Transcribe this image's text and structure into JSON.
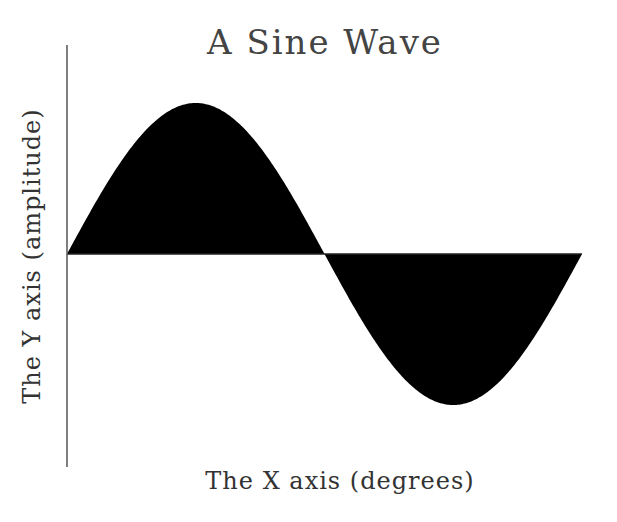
{
  "chart_data": {
    "type": "area",
    "title": "A Sine Wave",
    "xlabel": "The X axis (degrees)",
    "ylabel": "The Y axis (amplitude)",
    "x": [
      0,
      30,
      60,
      90,
      120,
      150,
      180,
      210,
      240,
      270,
      300,
      330,
      360
    ],
    "series": [
      {
        "name": "sin(x)",
        "values": [
          0,
          0.5,
          0.866,
          1,
          0.866,
          0.5,
          0,
          -0.5,
          -0.866,
          -1,
          -0.866,
          -0.5,
          0
        ],
        "fill": "#000000"
      }
    ],
    "xlim": [
      0,
      360
    ],
    "ylim": [
      -1.4,
      1.4
    ],
    "grid": false,
    "legend": "none",
    "tick_labels": false
  },
  "colors": {
    "fill": "#000000",
    "axis": "#555555",
    "text": "#333333",
    "background": "#ffffff"
  },
  "layout_px": {
    "axis_x": 67,
    "axis_top": 45,
    "axis_bottom": 467,
    "baseline_y": 254,
    "wave_x_start": 67,
    "wave_x_end": 582,
    "amplitude_px": 151
  }
}
